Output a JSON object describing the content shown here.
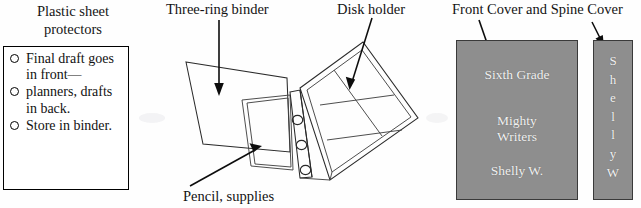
{
  "figure": {
    "background_color": "#fefefe",
    "ink_color": "#131313",
    "cover_fill_color": "#8e8e8e",
    "cover_border_color": "#3a3a3a",
    "cover_text_color": "#f2f2f2"
  },
  "checklist": {
    "title": "Plastic sheet protectors",
    "bullet_icon": "open-circle",
    "items": [
      "Final draft goes in front—",
      "planners, drafts in back.",
      "Store in binder."
    ]
  },
  "diagram": {
    "labels": {
      "binder": "Three-ring binder",
      "disk_holder": "Disk holder",
      "pencil": "Pencil, supplies"
    },
    "ring_count": 3,
    "disk_grid": {
      "columns": 2,
      "rows": 3
    }
  },
  "covers": {
    "group_label": "Front Cover and Spine Cover",
    "front": {
      "line_1": "Sixth Grade",
      "line_2": "Mighty",
      "line_3": "Writers",
      "line_4": "Shelly W."
    },
    "spine": {
      "letters": [
        "S",
        "h",
        "e",
        "l",
        "l",
        "y",
        "W"
      ]
    }
  }
}
